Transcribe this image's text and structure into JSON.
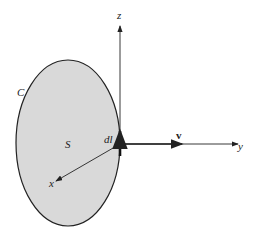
{
  "diagram": {
    "labels": {
      "curve": "C",
      "surface": "S",
      "line_element": "dl",
      "velocity": "v",
      "x_axis": "x",
      "y_axis": "y",
      "z_axis": "z"
    },
    "colors": {
      "surface_fill": "#d9d9d9",
      "stroke": "#222222"
    }
  }
}
